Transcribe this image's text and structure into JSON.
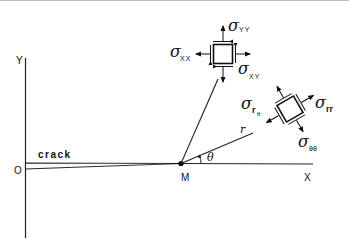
{
  "diagram": {
    "axes": {
      "y_label": "Y",
      "x_label": "X",
      "origin_label": "O"
    },
    "crack_label": "crack",
    "crack_tip_label": "M",
    "polar": {
      "radius_label": "r",
      "angle_label": "θ"
    },
    "cartesian_element": {
      "sigma": "σ",
      "normal_x_sub": "XX",
      "normal_y_sub": "YY",
      "shear_sub": "XY"
    },
    "polar_element": {
      "sigma": "σ",
      "radial_sub": "rr",
      "hoop_sub": "θθ",
      "shear_sub_r": "r",
      "shear_sub_theta": "θ"
    },
    "colors": {
      "ink": "#111111",
      "background": "#ffffff"
    }
  }
}
